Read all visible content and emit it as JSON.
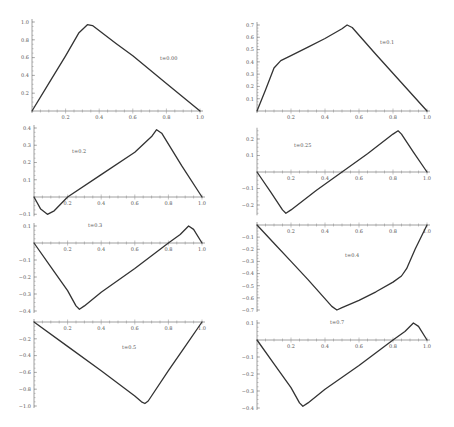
{
  "style": {
    "curve_color": "#333333",
    "axis_color": "#888888",
    "tick_label_color": "#555555",
    "background": "#ffffff"
  },
  "chart_data": [
    {
      "type": "line",
      "title": "",
      "label": "t=0.00",
      "xlabel": "",
      "ylabel": "",
      "xlim": [
        0,
        1
      ],
      "ylim": [
        0,
        1.0
      ],
      "xticks": [
        0.2,
        0.4,
        0.6,
        0.8,
        1.0
      ],
      "yticks": [
        0.2,
        0.4,
        0.6,
        0.8,
        1.0
      ],
      "x": [
        0,
        0.1,
        0.2,
        0.28,
        0.33,
        0.36,
        0.5,
        0.6,
        0.8,
        1.0
      ],
      "y": [
        0,
        0.31,
        0.62,
        0.88,
        0.97,
        0.96,
        0.76,
        0.62,
        0.31,
        0
      ]
    },
    {
      "type": "line",
      "title": "",
      "label": "t=0.1",
      "xlabel": "",
      "ylabel": "",
      "xlim": [
        0,
        1
      ],
      "ylim": [
        0,
        0.7
      ],
      "xticks": [
        0.2,
        0.4,
        0.6,
        0.8,
        1.0
      ],
      "yticks": [
        0.1,
        0.2,
        0.3,
        0.4,
        0.5,
        0.6,
        0.7
      ],
      "x": [
        0,
        0.05,
        0.1,
        0.14,
        0.2,
        0.3,
        0.4,
        0.5,
        0.53,
        0.56,
        0.7,
        0.85,
        1.0
      ],
      "y": [
        0,
        0.17,
        0.35,
        0.41,
        0.45,
        0.52,
        0.59,
        0.67,
        0.7,
        0.68,
        0.46,
        0.23,
        0
      ]
    },
    {
      "type": "line",
      "title": "",
      "label": "t=0.2",
      "xlabel": "",
      "ylabel": "",
      "xlim": [
        0,
        1
      ],
      "ylim": [
        -0.1,
        0.4
      ],
      "xticks": [
        0.2,
        0.4,
        0.6,
        0.8,
        1.0
      ],
      "yticks": [
        -0.1,
        0.1,
        0.2,
        0.3,
        0.4
      ],
      "x": [
        0,
        0.04,
        0.08,
        0.12,
        0.2,
        0.4,
        0.6,
        0.7,
        0.73,
        0.76,
        0.88,
        1.0
      ],
      "y": [
        0,
        -0.07,
        -0.1,
        -0.08,
        0,
        0.13,
        0.26,
        0.35,
        0.39,
        0.37,
        0.18,
        0
      ]
    },
    {
      "type": "line",
      "title": "",
      "label": "t=0.25",
      "xlabel": "",
      "ylabel": "",
      "xlim": [
        0,
        1
      ],
      "ylim": [
        -0.25,
        0.25
      ],
      "xticks": [
        0.2,
        0.4,
        0.6,
        0.8,
        1.0
      ],
      "yticks": [
        -0.2,
        -0.1,
        0.1,
        0.2
      ],
      "x": [
        0,
        0.08,
        0.15,
        0.17,
        0.2,
        0.35,
        0.5,
        0.65,
        0.8,
        0.83,
        0.85,
        0.92,
        1.0
      ],
      "y": [
        0,
        -0.12,
        -0.23,
        -0.25,
        -0.23,
        -0.11,
        0,
        0.11,
        0.23,
        0.25,
        0.23,
        0.12,
        0
      ]
    },
    {
      "type": "line",
      "title": "",
      "label": "t=0.3",
      "xlabel": "",
      "ylabel": "",
      "xlim": [
        0,
        1
      ],
      "ylim": [
        -0.4,
        0.1
      ],
      "xticks": [
        0.2,
        0.4,
        0.6,
        0.8,
        1.0
      ],
      "yticks": [
        -0.4,
        -0.3,
        -0.2,
        -0.1,
        0.1
      ],
      "x": [
        0,
        0.1,
        0.2,
        0.25,
        0.27,
        0.3,
        0.4,
        0.6,
        0.8,
        0.87,
        0.92,
        0.95,
        1.0
      ],
      "y": [
        0,
        -0.14,
        -0.28,
        -0.37,
        -0.39,
        -0.37,
        -0.29,
        -0.15,
        0,
        0.05,
        0.1,
        0.08,
        0
      ]
    },
    {
      "type": "line",
      "title": "",
      "label": "t=0.4",
      "xlabel": "",
      "ylabel": "",
      "xlim": [
        0,
        1
      ],
      "ylim": [
        -0.7,
        0
      ],
      "xticks": [
        0.2,
        0.4,
        0.6,
        0.8,
        1.0
      ],
      "yticks": [
        -0.1,
        -0.2,
        -0.3,
        -0.4,
        -0.5,
        -0.6,
        -0.7
      ],
      "x": [
        0,
        0.1,
        0.2,
        0.3,
        0.44,
        0.47,
        0.5,
        0.6,
        0.7,
        0.8,
        0.85,
        0.88,
        0.93,
        1.0
      ],
      "y": [
        0,
        -0.15,
        -0.3,
        -0.45,
        -0.67,
        -0.7,
        -0.68,
        -0.62,
        -0.55,
        -0.47,
        -0.42,
        -0.36,
        -0.2,
        0
      ]
    },
    {
      "type": "line",
      "title": "",
      "label": "t=0.5",
      "xlabel": "",
      "ylabel": "",
      "xlim": [
        0,
        1
      ],
      "ylim": [
        -1.0,
        0
      ],
      "xticks": [
        0.2,
        0.4,
        0.6,
        0.8,
        1.0
      ],
      "yticks": [
        -0.2,
        -0.4,
        -0.6,
        -0.8,
        -1.0
      ],
      "x": [
        0,
        0.2,
        0.4,
        0.6,
        0.64,
        0.66,
        0.68,
        0.8,
        0.9,
        1.0
      ],
      "y": [
        0,
        -0.29,
        -0.58,
        -0.88,
        -0.95,
        -0.97,
        -0.94,
        -0.58,
        -0.29,
        0
      ]
    },
    {
      "type": "line",
      "title": "",
      "label": "t=0.7",
      "xlabel": "",
      "ylabel": "",
      "xlim": [
        0,
        1
      ],
      "ylim": [
        -0.4,
        0.1
      ],
      "xticks": [
        0.2,
        0.4,
        0.6,
        0.8,
        1.0
      ],
      "yticks": [
        -0.4,
        -0.3,
        -0.2,
        -0.1,
        0.1
      ],
      "x": [
        0,
        0.1,
        0.2,
        0.25,
        0.27,
        0.3,
        0.4,
        0.6,
        0.8,
        0.87,
        0.92,
        0.95,
        1.0
      ],
      "y": [
        0,
        -0.14,
        -0.28,
        -0.37,
        -0.39,
        -0.37,
        -0.29,
        -0.15,
        0,
        0.05,
        0.1,
        0.08,
        0
      ]
    }
  ],
  "panels": [
    {
      "x0": 32,
      "x1": 200,
      "yAxisPix": 111,
      "ref": [
        1.0,
        22
      ],
      "label_pos": [
        160,
        60
      ]
    },
    {
      "x0": 257,
      "x1": 427,
      "yAxisPix": 111,
      "ref": [
        0.7,
        25
      ],
      "label_pos": [
        380,
        44
      ]
    },
    {
      "x0": 34,
      "x1": 202,
      "yAxisPix": 197,
      "ref": [
        0.4,
        128
      ],
      "label_pos": [
        72,
        153
      ]
    },
    {
      "x0": 257,
      "x1": 427,
      "yAxisPix": 172,
      "ref": [
        0.2,
        139
      ],
      "label_pos": [
        294,
        147
      ]
    },
    {
      "x0": 34,
      "x1": 202,
      "yAxisPix": 243,
      "ref": [
        0.1,
        226
      ],
      "label_pos": [
        88,
        227
      ]
    },
    {
      "x0": 257,
      "x1": 427,
      "yAxisPix": 225,
      "ref": [
        -0.7,
        310
      ],
      "label_pos": [
        345,
        257
      ]
    },
    {
      "x0": 34,
      "x1": 202,
      "yAxisPix": 322,
      "ref": [
        -1.0,
        406
      ],
      "label_pos": [
        122,
        349
      ]
    },
    {
      "x0": 257,
      "x1": 427,
      "yAxisPix": 340,
      "ref": [
        0.1,
        323
      ],
      "label_pos": [
        330,
        324
      ]
    }
  ]
}
